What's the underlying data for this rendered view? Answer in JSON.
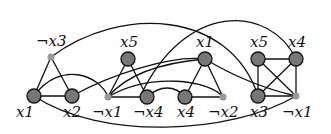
{
  "diagram": {
    "type": "graph",
    "nodes": [
      {
        "id": "n1",
        "label": "¬x3",
        "x": 51,
        "y": 57,
        "kind": "small",
        "lx": 36,
        "ly": 46
      },
      {
        "id": "n2",
        "label": "x1",
        "x": 34,
        "y": 96,
        "kind": "big",
        "lx": 16,
        "ly": 117
      },
      {
        "id": "n3",
        "label": "x2",
        "x": 72,
        "y": 96,
        "kind": "big",
        "lx": 63,
        "ly": 117
      },
      {
        "id": "n4",
        "label": "¬x1",
        "x": 108,
        "y": 97,
        "kind": "small",
        "lx": 92,
        "ly": 117
      },
      {
        "id": "n5",
        "label": "x5",
        "x": 128,
        "y": 59,
        "kind": "big",
        "lx": 120,
        "ly": 47
      },
      {
        "id": "n6",
        "label": "¬x4",
        "x": 147,
        "y": 97,
        "kind": "big",
        "lx": 133,
        "ly": 117
      },
      {
        "id": "n7",
        "label": "x1",
        "x": 205,
        "y": 59,
        "kind": "big",
        "lx": 196,
        "ly": 47
      },
      {
        "id": "n8",
        "label": "x4",
        "x": 185,
        "y": 97,
        "kind": "big",
        "lx": 177,
        "ly": 117
      },
      {
        "id": "n9",
        "label": "¬x2",
        "x": 223,
        "y": 97,
        "kind": "small",
        "lx": 208,
        "ly": 117
      },
      {
        "id": "n10",
        "label": "x5",
        "x": 258,
        "y": 59,
        "kind": "big",
        "lx": 250,
        "ly": 47
      },
      {
        "id": "n11",
        "label": "x4",
        "x": 296,
        "y": 59,
        "kind": "big",
        "lx": 288,
        "ly": 47
      },
      {
        "id": "n12",
        "label": "x3",
        "x": 258,
        "y": 96,
        "kind": "big",
        "lx": 250,
        "ly": 117
      },
      {
        "id": "n13",
        "label": "¬x1",
        "x": 296,
        "y": 96,
        "kind": "small",
        "lx": 282,
        "ly": 117
      }
    ],
    "edges": [
      {
        "d": "M51,57 L34,96"
      },
      {
        "d": "M51,57 L72,96"
      },
      {
        "d": "M34,96 L72,96"
      },
      {
        "d": "M128,59 L108,97"
      },
      {
        "d": "M128,59 L147,97"
      },
      {
        "d": "M108,97 L147,97"
      },
      {
        "d": "M205,59 L185,97"
      },
      {
        "d": "M205,59 L223,97"
      },
      {
        "d": "M185,97 L223,97"
      },
      {
        "d": "M258,59 L296,59"
      },
      {
        "d": "M258,59 L258,96"
      },
      {
        "d": "M258,59 L296,96"
      },
      {
        "d": "M296,59 L258,96"
      },
      {
        "d": "M296,59 L296,96"
      },
      {
        "d": "M258,96 L296,96"
      },
      {
        "d": "M51,57 C120,5 230,10 258,96"
      },
      {
        "d": "M296,59 C270,5 185,0 140,97"
      },
      {
        "d": "M34,96 C60,60 100,75 108,97"
      },
      {
        "d": "M72,96 C110,75 170,55 205,59"
      },
      {
        "d": "M108,97 C150,72 210,80 223,97"
      },
      {
        "d": "M147,97 C160,85 175,85 185,97"
      },
      {
        "d": "M205,59 C240,80 270,90 296,96"
      },
      {
        "d": "M34,96 C100,140 230,135 296,96"
      },
      {
        "d": "M108,97 C130,70 170,62 205,59"
      }
    ]
  }
}
